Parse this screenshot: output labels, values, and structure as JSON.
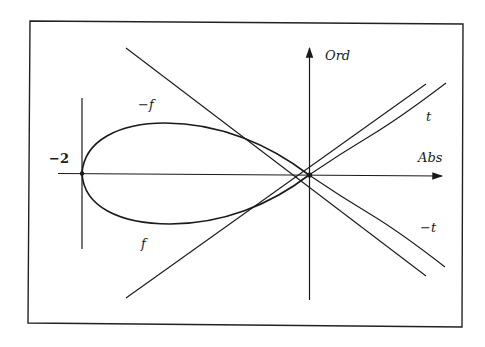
{
  "figure": {
    "type": "curve-plot",
    "frame": {
      "stroke": "#222222"
    },
    "axes": {
      "x_label": "Abs",
      "y_label": "Ord",
      "origin": [
        309,
        175
      ]
    },
    "labels": {
      "minus_two": "−2",
      "minus_f": "−f",
      "f": "f",
      "t": "t",
      "minus_t": "−t"
    },
    "curves": [
      {
        "name": "f",
        "description": "lower branch of loop from (-2,0) to origin"
      },
      {
        "name": "-f",
        "description": "upper branch of loop from (-2,0) to origin"
      }
    ],
    "lines": [
      {
        "name": "tangent-descending",
        "from": [
          126,
          48
        ],
        "to": [
          426,
          276
        ]
      },
      {
        "name": "tangent-ascending",
        "from": [
          126,
          298
        ],
        "to": [
          426,
          84
        ]
      },
      {
        "name": "t",
        "from": [
          309,
          175
        ],
        "to": [
          446,
          83
        ]
      },
      {
        "name": "-t",
        "from": [
          309,
          175
        ],
        "to": [
          445,
          267
        ]
      },
      {
        "name": "vertical-at-minus-two",
        "from": [
          82,
          98
        ],
        "to": [
          82,
          249
        ]
      }
    ]
  }
}
